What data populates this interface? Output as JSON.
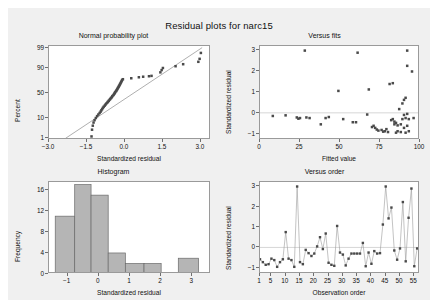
{
  "figure": {
    "title": "Residual plots for narc15",
    "background_color": "#f0f0f0",
    "panel_color": "#ffffff",
    "point_color": "#4a4a4a",
    "bar_color": "#b5b5b5"
  },
  "chart_data": [
    {
      "type": "scatter",
      "title": "Normal probability plot",
      "xlabel": "Standardized residual",
      "ylabel": "Percent",
      "xlim": [
        -3.0,
        3.4
      ],
      "ylim": [
        1,
        99
      ],
      "xticks": [
        "-3.0",
        "-1.5",
        "0.0",
        "1.5",
        "3.0"
      ],
      "xtick_values": [
        -3.0,
        -1.5,
        0.0,
        1.5,
        3.0
      ],
      "yticks": [
        "99",
        "90",
        "50",
        "10",
        "1"
      ],
      "ytick_values": [
        99,
        90,
        50,
        10,
        1
      ],
      "grid": false,
      "reference_line": {
        "x": [
          -2.35,
          3.05
        ],
        "y": [
          1,
          99
        ]
      },
      "points": [
        {
          "x": -1.32,
          "y": 1.3
        },
        {
          "x": -1.3,
          "y": 3.0
        },
        {
          "x": -1.27,
          "y": 4.7
        },
        {
          "x": -1.24,
          "y": 6.5
        },
        {
          "x": -1.2,
          "y": 8.2
        },
        {
          "x": -1.15,
          "y": 10.0
        },
        {
          "x": -1.1,
          "y": 11.8
        },
        {
          "x": -1.05,
          "y": 13.5
        },
        {
          "x": -1.0,
          "y": 15.3
        },
        {
          "x": -0.96,
          "y": 17.0
        },
        {
          "x": -0.93,
          "y": 18.8
        },
        {
          "x": -0.9,
          "y": 20.5
        },
        {
          "x": -0.87,
          "y": 22.3
        },
        {
          "x": -0.84,
          "y": 24.0
        },
        {
          "x": -0.8,
          "y": 25.8
        },
        {
          "x": -0.77,
          "y": 27.5
        },
        {
          "x": -0.74,
          "y": 29.3
        },
        {
          "x": -0.7,
          "y": 31.0
        },
        {
          "x": -0.67,
          "y": 32.8
        },
        {
          "x": -0.64,
          "y": 34.5
        },
        {
          "x": -0.61,
          "y": 36.3
        },
        {
          "x": -0.58,
          "y": 38.0
        },
        {
          "x": -0.55,
          "y": 39.8
        },
        {
          "x": -0.52,
          "y": 41.5
        },
        {
          "x": -0.5,
          "y": 43.3
        },
        {
          "x": -0.47,
          "y": 45.0
        },
        {
          "x": -0.44,
          "y": 46.8
        },
        {
          "x": -0.42,
          "y": 48.5
        },
        {
          "x": -0.4,
          "y": 50.3
        },
        {
          "x": -0.38,
          "y": 52.0
        },
        {
          "x": -0.35,
          "y": 53.8
        },
        {
          "x": -0.33,
          "y": 55.5
        },
        {
          "x": -0.31,
          "y": 57.3
        },
        {
          "x": -0.29,
          "y": 59.0
        },
        {
          "x": -0.27,
          "y": 60.8
        },
        {
          "x": -0.25,
          "y": 62.5
        },
        {
          "x": -0.23,
          "y": 64.3
        },
        {
          "x": -0.21,
          "y": 66.0
        },
        {
          "x": -0.19,
          "y": 67.8
        },
        {
          "x": -0.17,
          "y": 69.5
        },
        {
          "x": -0.15,
          "y": 71.3
        },
        {
          "x": -0.13,
          "y": 73.0
        },
        {
          "x": -0.11,
          "y": 74.8
        },
        {
          "x": -0.08,
          "y": 76.0
        },
        {
          "x": 0.25,
          "y": 77.5
        },
        {
          "x": 0.55,
          "y": 79.0
        },
        {
          "x": 0.72,
          "y": 79.8
        },
        {
          "x": 0.95,
          "y": 80.5
        },
        {
          "x": 1.05,
          "y": 81.0
        },
        {
          "x": 1.4,
          "y": 85.5
        },
        {
          "x": 1.45,
          "y": 88.0
        },
        {
          "x": 1.5,
          "y": 90.0
        },
        {
          "x": 2.0,
          "y": 91.5
        },
        {
          "x": 2.3,
          "y": 93.0
        },
        {
          "x": 2.9,
          "y": 94.5
        },
        {
          "x": 2.95,
          "y": 96.0
        },
        {
          "x": 3.0,
          "y": 98.0
        }
      ]
    },
    {
      "type": "scatter",
      "title": "Versus fits",
      "xlabel": "Fitted value",
      "ylabel": "Standardized residual",
      "xlim": [
        0,
        100
      ],
      "ylim": [
        -1.3,
        3.2
      ],
      "xticks": [
        "0",
        "25",
        "50",
        "75",
        "100"
      ],
      "xtick_values": [
        0,
        25,
        50,
        75,
        100
      ],
      "yticks": [
        "3",
        "2",
        "1",
        "0",
        "-1"
      ],
      "ytick_values": [
        3,
        2,
        1,
        0,
        -1
      ],
      "grid": false,
      "zero_line": 0,
      "points": [
        {
          "x": 8,
          "y": -0.15
        },
        {
          "x": 16,
          "y": -0.12
        },
        {
          "x": 23,
          "y": -0.22
        },
        {
          "x": 24,
          "y": -0.28
        },
        {
          "x": 25,
          "y": -0.25
        },
        {
          "x": 28,
          "y": 2.98
        },
        {
          "x": 29,
          "y": -0.22
        },
        {
          "x": 31,
          "y": -0.25
        },
        {
          "x": 38,
          "y": -0.55
        },
        {
          "x": 41,
          "y": -0.25
        },
        {
          "x": 43,
          "y": -0.2
        },
        {
          "x": 49,
          "y": 1.05
        },
        {
          "x": 52,
          "y": -0.3
        },
        {
          "x": 58,
          "y": -0.45
        },
        {
          "x": 60,
          "y": -0.45
        },
        {
          "x": 61,
          "y": 2.88
        },
        {
          "x": 67,
          "y": -0.08
        },
        {
          "x": 68,
          "y": 1.12
        },
        {
          "x": 70,
          "y": -0.68
        },
        {
          "x": 71,
          "y": -0.62
        },
        {
          "x": 72,
          "y": -0.72
        },
        {
          "x": 73,
          "y": -0.8
        },
        {
          "x": 74,
          "y": -0.85
        },
        {
          "x": 76,
          "y": -0.82
        },
        {
          "x": 77,
          "y": -0.9
        },
        {
          "x": 78,
          "y": -0.88
        },
        {
          "x": 79,
          "y": -0.78
        },
        {
          "x": 80,
          "y": -0.92
        },
        {
          "x": 81,
          "y": 1.38
        },
        {
          "x": 82,
          "y": -0.35
        },
        {
          "x": 83,
          "y": -0.3
        },
        {
          "x": 83,
          "y": 1.42
        },
        {
          "x": 84,
          "y": -0.42
        },
        {
          "x": 84,
          "y": -0.55
        },
        {
          "x": 85,
          "y": -0.48
        },
        {
          "x": 85,
          "y": -0.95
        },
        {
          "x": 86,
          "y": -0.6
        },
        {
          "x": 86,
          "y": -0.88
        },
        {
          "x": 87,
          "y": 0.18
        },
        {
          "x": 88,
          "y": -0.55
        },
        {
          "x": 88,
          "y": -0.92
        },
        {
          "x": 89,
          "y": 0.45
        },
        {
          "x": 89,
          "y": -0.3
        },
        {
          "x": 90,
          "y": 0.62
        },
        {
          "x": 90,
          "y": -0.1
        },
        {
          "x": 90,
          "y": -0.72
        },
        {
          "x": 91,
          "y": 0.72
        },
        {
          "x": 91,
          "y": -0.25
        },
        {
          "x": 91,
          "y": -0.95
        },
        {
          "x": 92,
          "y": 2.98
        },
        {
          "x": 92,
          "y": 2.25
        },
        {
          "x": 92,
          "y": -0.05
        },
        {
          "x": 92,
          "y": -0.62
        },
        {
          "x": 93,
          "y": -0.3
        },
        {
          "x": 93,
          "y": -0.88
        },
        {
          "x": 95,
          "y": 1.98
        },
        {
          "x": 96,
          "y": -0.25
        }
      ]
    },
    {
      "type": "bar",
      "title": "Histogram",
      "xlabel": "Standardized residual",
      "ylabel": "Frequency",
      "xlim": [
        -1.6,
        3.6
      ],
      "ylim": [
        0,
        17.5
      ],
      "xticks": [
        "-1",
        "0",
        "1",
        "2",
        "3"
      ],
      "xtick_values": [
        -1,
        0,
        1,
        2,
        3
      ],
      "yticks": [
        "16",
        "12",
        "8",
        "4",
        "0"
      ],
      "ytick_values": [
        16,
        12,
        8,
        4,
        0
      ],
      "grid": false,
      "bin_width": 0.625,
      "bins": [
        {
          "left": -1.4,
          "right": -0.775,
          "value": 11
        },
        {
          "left": -0.775,
          "right": -0.25,
          "value": 17
        },
        {
          "left": -0.25,
          "right": 0.3,
          "value": 15
        },
        {
          "left": 0.3,
          "right": 0.85,
          "value": 4
        },
        {
          "left": 0.85,
          "right": 1.45,
          "value": 2
        },
        {
          "left": 1.45,
          "right": 2.0,
          "value": 2
        },
        {
          "left": 2.0,
          "right": 2.55,
          "value": 0
        },
        {
          "left": 2.55,
          "right": 3.2,
          "value": 3
        }
      ]
    },
    {
      "type": "line",
      "title": "Versus order",
      "xlabel": "Observation order",
      "ylabel": "Standardized residual",
      "xlim": [
        1,
        57
      ],
      "ylim": [
        -1.3,
        3.2
      ],
      "xticks": [
        "1",
        "5",
        "10",
        "15",
        "20",
        "25",
        "30",
        "35",
        "40",
        "45",
        "50",
        "55"
      ],
      "xtick_values": [
        1,
        5,
        10,
        15,
        20,
        25,
        30,
        35,
        40,
        45,
        50,
        55
      ],
      "yticks": [
        "3",
        "2",
        "1",
        "0",
        "-1"
      ],
      "ytick_values": [
        3,
        2,
        1,
        0,
        -1
      ],
      "grid": false,
      "zero_line": 0,
      "markers": true,
      "values": [
        -0.58,
        -0.72,
        -0.85,
        -0.82,
        -0.55,
        -0.62,
        -0.95,
        -0.72,
        -0.58,
        0.75,
        -0.55,
        -0.62,
        -0.95,
        2.98,
        -0.72,
        -0.82,
        -0.12,
        -0.28,
        -0.42,
        -0.3,
        0.05,
        0.5,
        -0.08,
        0.68,
        -0.75,
        -0.85,
        -0.9,
        1.05,
        -0.25,
        -0.35,
        -0.88,
        -0.55,
        -0.3,
        -0.3,
        -0.3,
        -0.3,
        0.22,
        -0.92,
        -0.25,
        -0.8,
        -0.18,
        -0.3,
        -0.28,
        1.12,
        2.98,
        1.42,
        1.95,
        -0.15,
        -0.6,
        -0.05,
        2.22,
        -0.68,
        1.45,
        2.88,
        -0.92,
        -0.05
      ]
    }
  ]
}
